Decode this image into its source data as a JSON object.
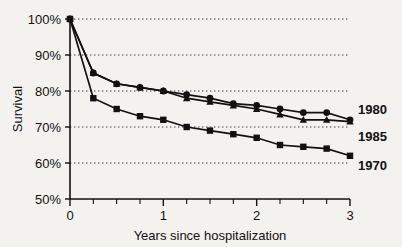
{
  "chart_data": {
    "type": "line",
    "title": "",
    "subtitle": "",
    "xlabel": "Years since hospitalization",
    "ylabel": "Survival",
    "xlim": [
      0,
      3
    ],
    "ylim": [
      50,
      100
    ],
    "x_ticks": [
      0,
      1,
      2,
      3
    ],
    "x_tick_labels": [
      "0",
      "1",
      "2",
      "3"
    ],
    "x_minor_step": 0.25,
    "y_ticks": [
      50,
      60,
      70,
      80,
      90,
      100
    ],
    "y_tick_labels": [
      "50%",
      "60%",
      "70%",
      "80%",
      "90%",
      "100%"
    ],
    "grid": "horizontal-dotted",
    "legend_position": "right-of-axes",
    "x": [
      0,
      0.25,
      0.5,
      0.75,
      1.0,
      1.25,
      1.5,
      1.75,
      2.0,
      2.25,
      2.5,
      2.75,
      3.0
    ],
    "series": [
      {
        "name": "1980",
        "marker": "circle",
        "values": [
          100,
          85,
          82,
          81,
          80,
          79,
          78,
          76.5,
          76,
          75,
          74,
          74,
          72
        ]
      },
      {
        "name": "1985",
        "marker": "triangle",
        "values": [
          100,
          85,
          82,
          81,
          80,
          78,
          77,
          76,
          75,
          73.5,
          72,
          72,
          71.5
        ]
      },
      {
        "name": "1970",
        "marker": "square",
        "values": [
          100,
          78,
          75,
          73,
          72,
          70,
          69,
          68,
          67,
          65,
          64.5,
          64,
          62
        ]
      }
    ]
  },
  "axes": {
    "y_title": "Survival",
    "x_title": "Years since hospitalization"
  },
  "legend": {
    "items": [
      {
        "label": "1980"
      },
      {
        "label": "1985"
      },
      {
        "label": "1970"
      }
    ]
  },
  "colors": {
    "ink": "#111111",
    "background": "#f4f2ee",
    "gridline": "#333333"
  }
}
